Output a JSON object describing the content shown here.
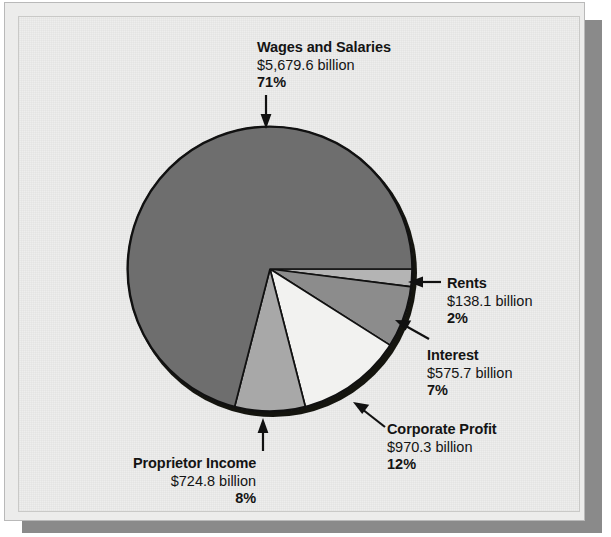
{
  "figure": {
    "title": "",
    "background_color": "#eeeeed",
    "shadow_color": "#8a8a8a"
  },
  "chart_data": {
    "type": "pie",
    "title": "",
    "xlabel": "",
    "ylabel": "",
    "units": "billion dollars",
    "legend_position": "callout-labels",
    "grid": false,
    "categories": [
      "Wages and Salaries",
      "Rents",
      "Interest",
      "Corporate Profit",
      "Proprietor Income"
    ],
    "values": [
      5679.6,
      138.1,
      575.7,
      970.3,
      724.8
    ],
    "percents": [
      71,
      2,
      7,
      12,
      8
    ],
    "slice_colors": [
      "#6e6e6e",
      "#b4b4b4",
      "#8c8c8c",
      "#f2f2f0",
      "#a8a8a8"
    ],
    "slices": [
      {
        "label": "Wages and Salaries",
        "amount": "$5,679.6 billion",
        "percent": "71%",
        "value": 5679.6,
        "percent_value": 71,
        "color": "#6e6e6e"
      },
      {
        "label": "Rents",
        "amount": "$138.1 billion",
        "percent": "2%",
        "value": 138.1,
        "percent_value": 2,
        "color": "#b4b4b4"
      },
      {
        "label": "Interest",
        "amount": "$575.7 billion",
        "percent": "7%",
        "value": 575.7,
        "percent_value": 7,
        "color": "#8c8c8c"
      },
      {
        "label": "Corporate Profit",
        "amount": "$970.3 billion",
        "percent": "12%",
        "value": 970.3,
        "percent_value": 12,
        "color": "#f2f2f0"
      },
      {
        "label": "Proprietor Income",
        "amount": "$724.8 billion",
        "percent": "8%",
        "value": 724.8,
        "percent_value": 8,
        "color": "#a8a8a8"
      }
    ]
  }
}
